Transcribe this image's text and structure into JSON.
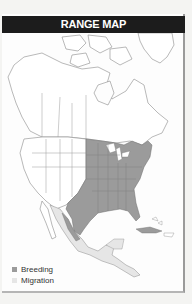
{
  "header": {
    "title": "RANGE MAP"
  },
  "legend": {
    "items": [
      {
        "label": "Breeding",
        "color": "#9b9b9b"
      },
      {
        "label": "Migration",
        "color": "#e6e6e6"
      }
    ]
  },
  "map": {
    "region": "North America",
    "colors": {
      "land": "#ffffff",
      "borders": "#8a8a8a",
      "breeding": "#9b9b9b",
      "migration": "#e6e6e6"
    }
  }
}
